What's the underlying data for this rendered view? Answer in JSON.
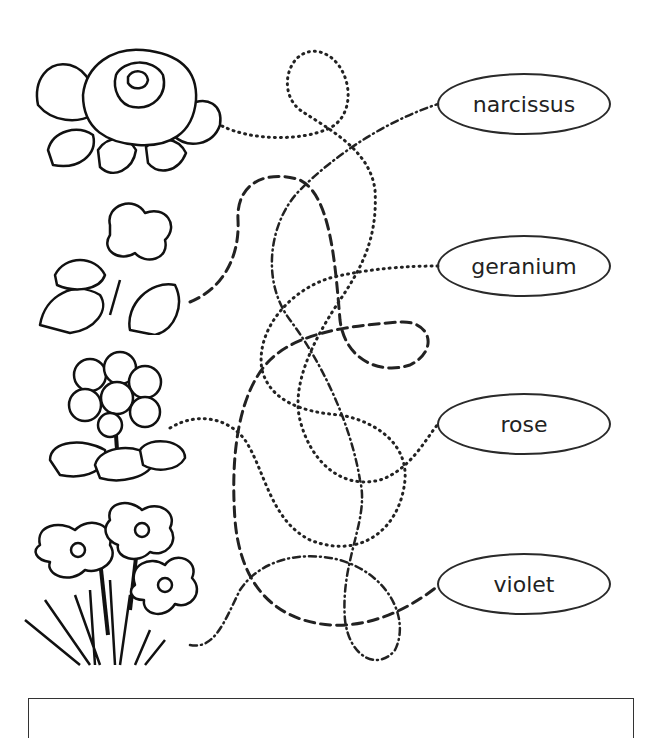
{
  "worksheet": {
    "type": "match flowers to names maze",
    "flowers": [
      {
        "id": "rose",
        "icon": "rose-icon",
        "position": "top"
      },
      {
        "id": "violet",
        "icon": "violet-icon",
        "position": "second"
      },
      {
        "id": "geranium",
        "icon": "geranium-icon",
        "position": "third"
      },
      {
        "id": "narcissus",
        "icon": "narcissus-icon",
        "position": "bottom"
      }
    ],
    "labels": [
      {
        "text": "narcissus"
      },
      {
        "text": "geranium"
      },
      {
        "text": "rose"
      },
      {
        "text": "violet"
      }
    ],
    "line_color": "#222222"
  }
}
